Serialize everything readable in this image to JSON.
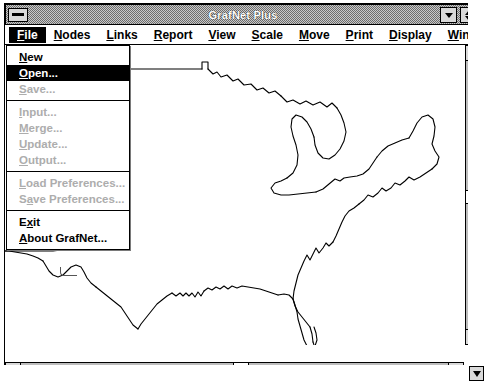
{
  "window": {
    "title": "GrafNet Plus",
    "sysmenu_icon": "system-menu-box",
    "minimize_icon": "minimize-arrow-icon",
    "maximize_icon": "maximize-restore-arrow-icon"
  },
  "menubar": {
    "items": [
      {
        "label": "File",
        "accel": "F",
        "active": true
      },
      {
        "label": "Nodes",
        "accel": "N",
        "active": false
      },
      {
        "label": "Links",
        "accel": "L",
        "active": false
      },
      {
        "label": "Report",
        "accel": "R",
        "active": false
      },
      {
        "label": "View",
        "accel": "V",
        "active": false
      },
      {
        "label": "Scale",
        "accel": "S",
        "active": false
      },
      {
        "label": "Move",
        "accel": "M",
        "active": false
      },
      {
        "label": "Print",
        "accel": "P",
        "active": false
      },
      {
        "label": "Display",
        "accel": "D",
        "active": false
      },
      {
        "label": "Window",
        "accel": "W",
        "active": false
      }
    ]
  },
  "file_menu": {
    "items": [
      {
        "label": "New",
        "accel": "N",
        "state": "enabled",
        "separator_after": false
      },
      {
        "label": "Open...",
        "accel": "O",
        "state": "selected",
        "separator_after": false
      },
      {
        "label": "Save...",
        "accel": "S",
        "state": "disabled",
        "separator_after": true
      },
      {
        "label": "Input...",
        "accel": "I",
        "state": "disabled",
        "separator_after": false
      },
      {
        "label": "Merge...",
        "accel": "M",
        "state": "disabled",
        "separator_after": false
      },
      {
        "label": "Update...",
        "accel": "U",
        "state": "disabled",
        "separator_after": false
      },
      {
        "label": "Output...",
        "accel": "O",
        "state": "disabled",
        "separator_after": true
      },
      {
        "label": "Load Preferences...",
        "accel": "L",
        "state": "disabled",
        "separator_after": false
      },
      {
        "label": "Save Preferences...",
        "accel": "a",
        "state": "disabled",
        "separator_after": true
      },
      {
        "label": "Exit",
        "accel": "x",
        "state": "enabled",
        "separator_after": false
      },
      {
        "label": "About GrafNet...",
        "accel": "A",
        "state": "enabled",
        "separator_after": false
      }
    ]
  },
  "map": {
    "name": "united-states-outline-map",
    "scale_label": "1000 miles",
    "stroke_color": "#000000",
    "background_color": "#ffffff"
  },
  "scrollbars": {
    "vertical": {
      "up_icon": "scroll-up-arrow-icon",
      "down_icon": "scroll-down-arrow-icon"
    },
    "horizontal": {
      "left_icon": "scroll-left-arrow-icon",
      "right_icon": "scroll-right-arrow-icon"
    },
    "corner_icon": "resize-down-arrow-icon"
  }
}
